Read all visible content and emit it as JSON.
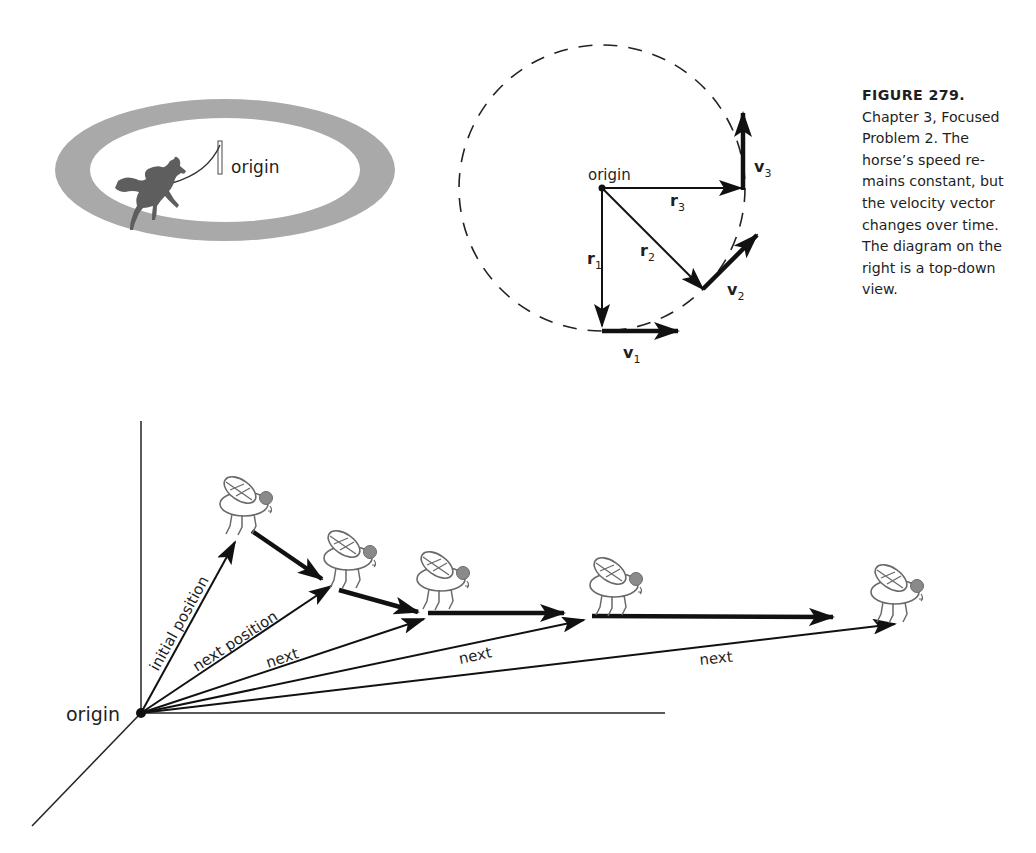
{
  "figure": {
    "number_label": "FIGURE 279.",
    "caption_lines": [
      "Chapter 3, Focused",
      "Problem 2. The",
      "horse’s speed re-",
      "mains constant, but",
      "the velocity vector",
      "changes over time.",
      "The diagram on the",
      "right is a top-down",
      "view."
    ]
  },
  "horse_panel": {
    "origin_label": "origin",
    "track_color": "#a9a9a9",
    "horse_color": "#5e5e5e"
  },
  "topdown_panel": {
    "origin_label": "origin",
    "vectors": {
      "r1": {
        "base": "r",
        "sub": "1"
      },
      "r2": {
        "base": "r",
        "sub": "2"
      },
      "r3": {
        "base": "r",
        "sub": "3"
      },
      "v1": {
        "base": "v",
        "sub": "1"
      },
      "v2": {
        "base": "v",
        "sub": "2"
      },
      "v3": {
        "base": "v",
        "sub": "3"
      }
    }
  },
  "fly_panel": {
    "origin_label": "origin",
    "position_labels": [
      "initial position",
      "next position",
      "next",
      "next",
      "next"
    ],
    "fly_eye_color": "#8a8a8a"
  }
}
